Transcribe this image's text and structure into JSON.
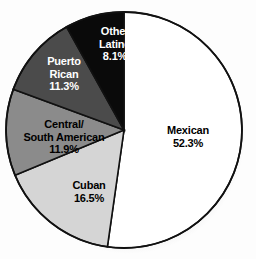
{
  "chart_data": {
    "type": "pie",
    "title": "",
    "subtitle": "",
    "xlabel": "",
    "ylabel": "",
    "legend_position": "none",
    "grid": false,
    "unit": "%",
    "start_angle_deg": 0,
    "direction": "clockwise",
    "categories": [
      "Mexican",
      "Cuban",
      "Central/South American",
      "Puerto Rican",
      "Other Latino"
    ],
    "values": [
      52.3,
      16.5,
      11.9,
      11.3,
      8.1
    ],
    "slices": [
      {
        "name": "Mexican",
        "label_line1": "Mexican",
        "label_line2": "",
        "percent_text": "52.3%",
        "value": 52.3,
        "fill": "#ffffff",
        "text_color": "#000000"
      },
      {
        "name": "Cuban",
        "label_line1": "Cuban",
        "label_line2": "",
        "percent_text": "16.5%",
        "value": 16.5,
        "fill": "#d5d5d5",
        "text_color": "#000000"
      },
      {
        "name": "Central/South American",
        "label_line1": "Central/",
        "label_line2": "South American",
        "percent_text": "11.9%",
        "value": 11.9,
        "fill": "#8b8b8b",
        "text_color": "#000000"
      },
      {
        "name": "Puerto Rican",
        "label_line1": "Puerto",
        "label_line2": "Rican",
        "percent_text": "11.3%",
        "value": 11.3,
        "fill": "#4b4b4b",
        "text_color": "#ffffff"
      },
      {
        "name": "Other Latino",
        "label_line1": "Other",
        "label_line2": "Latino",
        "percent_text": "8.1%",
        "value": 8.1,
        "fill": "#0a0a0a",
        "text_color": "#ffffff"
      }
    ],
    "stroke_color": "#111111",
    "background": "#fdfdfd"
  }
}
